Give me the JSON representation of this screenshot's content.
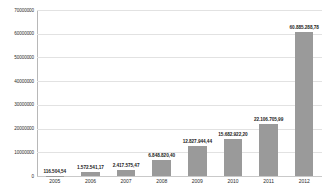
{
  "chart_data": {
    "type": "bar",
    "title": "",
    "xlabel": "",
    "ylabel": "",
    "categories": [
      "2005",
      "2006",
      "2007",
      "2008",
      "2009",
      "2010",
      "2011",
      "2012"
    ],
    "values": [
      116504.54,
      1572541.17,
      2417575.47,
      6848820.4,
      12827944.44,
      15682922.2,
      22106705.99,
      60885288.78
    ],
    "data_labels": [
      "116.504,54",
      "1.572.541,17",
      "2.417.575,47",
      "6.848.820,40",
      "12.827.944,44",
      "15.682.922,20",
      "22.106.705,99",
      "60.885.288,78"
    ],
    "ylim": [
      0,
      70000000
    ],
    "ytick_values": [
      0,
      10000000,
      20000000,
      30000000,
      40000000,
      50000000,
      60000000,
      70000000
    ],
    "ytick_labels": [
      "0",
      "10000000",
      "20000000",
      "30000000",
      "40000000",
      "50000000",
      "60000000",
      "70000000"
    ],
    "grid": true,
    "legend": false,
    "legend_position": "none",
    "bar_color": "#9a9a9a",
    "gridline_color": "#e2e2e2",
    "axis_color": "#b8b8b8",
    "background_color": "#ffffff"
  }
}
